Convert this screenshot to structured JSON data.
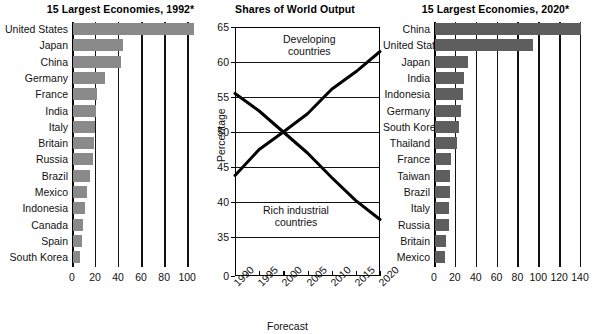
{
  "chart_data": [
    {
      "type": "bar",
      "orientation": "horizontal",
      "title": "15 Largest Economies, 1992*",
      "xlabel": "",
      "ylabel": "",
      "xlim": [
        0,
        108
      ],
      "xticks": [
        0,
        20,
        40,
        60,
        80,
        100
      ],
      "grid": true,
      "categories": [
        "United States",
        "Japan",
        "China",
        "Germany",
        "France",
        "India",
        "Italy",
        "Britain",
        "Russia",
        "Brazil",
        "Mexico",
        "Indonesia",
        "Canada",
        "Spain",
        "South Korea"
      ],
      "values": [
        105,
        43,
        42,
        28,
        21,
        20,
        19,
        18,
        17,
        15,
        12,
        10,
        9,
        8,
        6
      ],
      "bar_color": "#8a8a8a"
    },
    {
      "type": "line",
      "title": "Shares of World Output",
      "xlabel": "Forecast",
      "ylabel": "Percentage",
      "ylim": [
        35,
        65
      ],
      "yticks": [
        0,
        35,
        40,
        45,
        50,
        55,
        60,
        65
      ],
      "xticks": [
        "1990",
        "1995",
        "2000",
        "2005",
        "2010",
        "2015",
        "2020"
      ],
      "grid": true,
      "legend_position": "inline-annotations",
      "series": [
        {
          "name": "Developing countries",
          "x": [
            1990,
            1995,
            2000,
            2005,
            2010,
            2015,
            2020
          ],
          "values": [
            43.8,
            47.5,
            50.0,
            52.6,
            56.1,
            58.6,
            61.5
          ],
          "color": "#000000"
        },
        {
          "name": "Rich industrial countries",
          "x": [
            1990,
            1995,
            2000,
            2005,
            2010,
            2015,
            2020
          ],
          "values": [
            55.5,
            53.0,
            50.0,
            47.0,
            43.5,
            40.2,
            37.5
          ],
          "color": "#000000"
        }
      ]
    },
    {
      "type": "bar",
      "orientation": "horizontal",
      "title": "15 Largest Economies, 2020*",
      "xlabel": "",
      "ylabel": "",
      "xlim": [
        0,
        150
      ],
      "xticks": [
        0,
        20,
        40,
        60,
        80,
        100,
        120,
        140
      ],
      "grid": true,
      "categories": [
        "China",
        "United States",
        "Japan",
        "India",
        "Indonesia",
        "Germany",
        "South Korea",
        "Thailand",
        "France",
        "Taiwan",
        "Brazil",
        "Italy",
        "Russia",
        "Britain",
        "Mexico"
      ],
      "values": [
        140,
        94,
        32,
        28,
        27,
        25,
        23,
        21,
        15,
        14,
        14,
        13,
        13,
        11,
        10
      ],
      "bar_color": "#5e5e5e"
    }
  ],
  "left_chart": {
    "title": "15 Largest Economies, 1992*",
    "tick_labels": [
      "0",
      "20",
      "40",
      "60",
      "80",
      "100"
    ]
  },
  "middle_chart": {
    "title": "Shares of World Output",
    "y_axis_title": "Percentage",
    "x_axis_title": "Forecast",
    "y_tick_labels": [
      "65",
      "60",
      "55",
      "50",
      "45",
      "40",
      "35",
      "0"
    ],
    "x_tick_labels": [
      "1990",
      "1995",
      "2000",
      "2005",
      "2010",
      "2015",
      "2020"
    ],
    "annotation_developing_line1": "Developing",
    "annotation_developing_line2": "countries",
    "annotation_rich_line1": "Rich industrial",
    "annotation_rich_line2": "countries"
  },
  "right_chart": {
    "title": "15 Largest Economies, 2020*",
    "tick_labels": [
      "0",
      "20",
      "40",
      "60",
      "80",
      "100",
      "120",
      "140"
    ]
  }
}
